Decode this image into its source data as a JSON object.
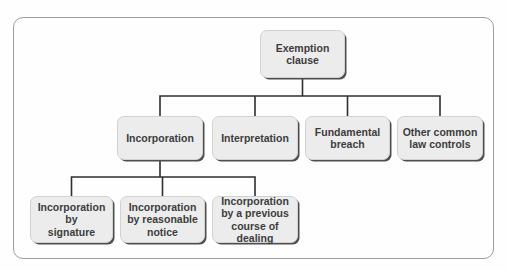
{
  "diagram": {
    "root": {
      "id": "exemption-clause",
      "label": [
        "Exemption",
        "clause"
      ]
    },
    "level2": [
      {
        "id": "incorporation",
        "label": [
          "Incorporation"
        ]
      },
      {
        "id": "interpretation",
        "label": [
          "Interpretation"
        ]
      },
      {
        "id": "fundamental-breach",
        "label": [
          "Fundamental",
          "breach"
        ]
      },
      {
        "id": "other-common-law-controls",
        "label": [
          "Other common",
          "law controls"
        ]
      }
    ],
    "level3": [
      {
        "id": "incorporation-by-signature",
        "label": [
          "Incorporation",
          "by",
          "signature"
        ]
      },
      {
        "id": "incorporation-by-reasonable-notice",
        "label": [
          "Incorporation",
          "by reasonable",
          "notice"
        ]
      },
      {
        "id": "incorporation-by-previous-course-of-dealing",
        "label": [
          "Incorporation",
          "by a previous",
          "course of dealing"
        ]
      }
    ],
    "colors": {
      "background": "#fefefe",
      "box_fill": "#ececec",
      "box_border": "#d2d2d2",
      "box_shadow": "#4e4e4e",
      "text": "#3c3c3c",
      "connector_line": "#2e2e2e",
      "frame_border": "#9e9e9e"
    }
  }
}
